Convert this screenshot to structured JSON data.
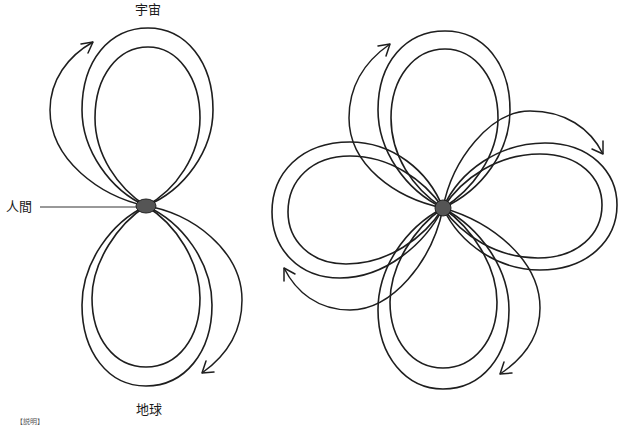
{
  "labels": {
    "top": "宇宙",
    "human": "人間",
    "bottom": "地球",
    "footer": "【説明】"
  },
  "colors": {
    "stroke": "#1e1e1e",
    "node_fill": "#555555",
    "background": "#ffffff"
  },
  "figures": [
    {
      "name": "left-figure",
      "description": "Two vertical lobes (up and down) meeting at a central node, each lobe with two nested loops and a curved arrow",
      "center": [
        146,
        206
      ],
      "lobes": 2,
      "arrows": [
        "upper-left clockwise",
        "lower-right clockwise"
      ]
    },
    {
      "name": "right-figure",
      "description": "Four lobes (up, right, down, left) rotated like a pinwheel, each with two nested loops and a curved arrow",
      "center": [
        443,
        208
      ],
      "lobes": 4,
      "arrows": [
        "top",
        "right",
        "bottom",
        "left"
      ]
    }
  ]
}
